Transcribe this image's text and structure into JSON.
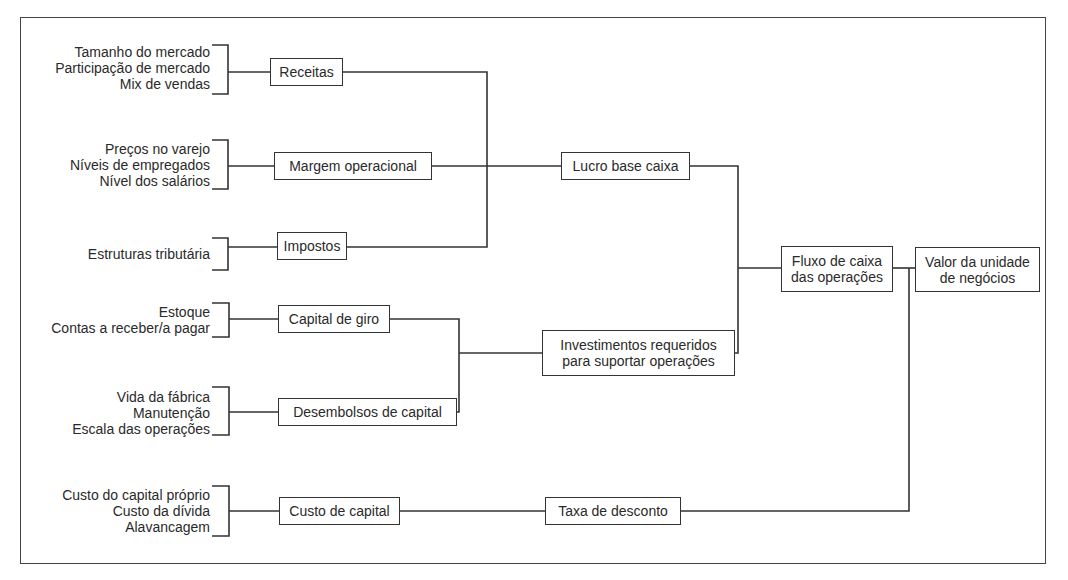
{
  "diagram": {
    "groups": [
      {
        "factors": [
          "Tamanho do mercado",
          "Participação de mercado",
          "Mix de vendas"
        ],
        "driver": "Receitas"
      },
      {
        "factors": [
          "Preços no varejo",
          "Níveis de empregados",
          "Nível dos salários"
        ],
        "driver": "Margem operacional"
      },
      {
        "factors": [
          "Estruturas tributária"
        ],
        "driver": "Impostos"
      },
      {
        "factors": [
          "Estoque",
          "Contas a receber/a pagar"
        ],
        "driver": "Capital de giro"
      },
      {
        "factors": [
          "Vida da fábrica",
          "Manutenção",
          "Escala das operações"
        ],
        "driver": "Desembolsos de capital"
      },
      {
        "factors": [
          "Custo do capital próprio",
          "Custo da dívida",
          "Alavancagem"
        ],
        "driver": "Custo de capital"
      }
    ],
    "intermediate": {
      "lucro": "Lucro base caixa",
      "investimentos": "Investimentos requeridos\npara suportar operações",
      "taxa": "Taxa de desconto"
    },
    "fluxo": "Fluxo de caixa\ndas operações",
    "valor": "Valor da unidade\nde negócios"
  }
}
